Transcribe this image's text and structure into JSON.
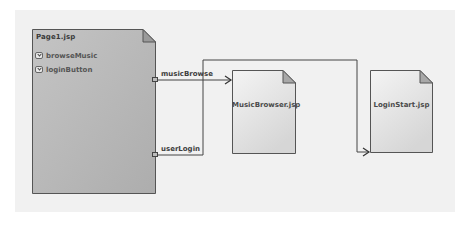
{
  "diagram": {
    "canvas_color": "#f1f1f1",
    "source_page": {
      "name": "Page1.jsp",
      "fill_color": "#b8b8b8",
      "triggers": [
        {
          "label": "browseMusic",
          "icon": "event-trigger-icon"
        },
        {
          "label": "loginButton",
          "icon": "event-trigger-icon"
        }
      ]
    },
    "target_pages": [
      {
        "name": "MusicBrowser.jsp"
      },
      {
        "name": "LoginStart.jsp"
      }
    ],
    "links": [
      {
        "label": "musicBrowse",
        "from": "Page1.jsp",
        "to": "MusicBrowser.jsp"
      },
      {
        "label": "userLogin",
        "from": "Page1.jsp",
        "to": "LoginStart.jsp"
      }
    ]
  }
}
